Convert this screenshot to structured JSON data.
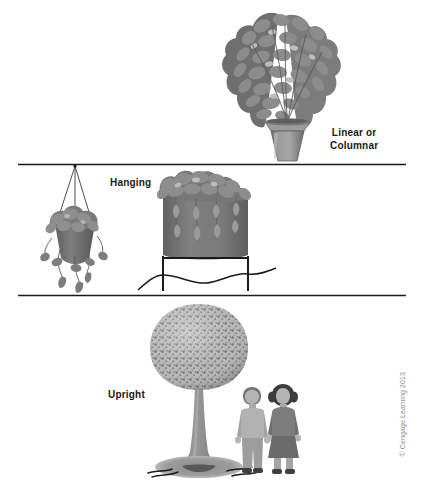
{
  "figure": {
    "background_color": "#ffffff",
    "width": 421,
    "height": 488
  },
  "panels": [
    {
      "id": "linear-columnar",
      "label": "Linear or\nColumnar",
      "label_line1": "Linear or",
      "label_line2": "Columnar",
      "subject": "tall-narrow-potted-plant"
    },
    {
      "id": "hanging",
      "label": "Hanging",
      "subject": "hanging-basket-and-raised-planter"
    },
    {
      "id": "upright",
      "label": "Upright",
      "subject": "round-crowned-shade-tree-with-two-people"
    }
  ],
  "labels": {
    "linear_line1": "Linear or",
    "linear_line2": "Columnar",
    "hanging": "Hanging",
    "upright": "Upright"
  },
  "credit": "© Cengage Learning 2013",
  "colors": {
    "line": "#1a1a1a",
    "foliage_dark": "#6e6e6e",
    "foliage_mid": "#8a8a8a",
    "foliage_light": "#a8a8a8",
    "crown_base": "#b4b4b4",
    "crown_speckle": "#6b6b6b",
    "pot": "#8f8f8f",
    "pot_shade": "#6f6f6f",
    "planter_body": "#7a7a7a",
    "trunk": "#8a8a8a",
    "shadow": "#9a9a9a",
    "figure_light": "#b0b0b0",
    "figure_dark": "#7d7d7d",
    "text": "#1a1a1a",
    "credit_text": "#8c8c8c"
  },
  "dividers": [
    {
      "name": "divider-top",
      "y": 164,
      "x1": 18,
      "x2": 406
    },
    {
      "name": "divider-bottom",
      "y": 295,
      "x1": 18,
      "x2": 406
    }
  ]
}
